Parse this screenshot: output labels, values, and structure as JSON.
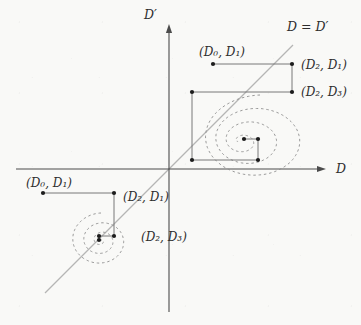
{
  "axes": {
    "x_label": "D",
    "y_label": "D′",
    "diagonal_label": "D = D′"
  },
  "upper_cobweb": {
    "labels": {
      "p01": "(D₀, D₁)",
      "p21": "(D₂, D₁)",
      "p23": "(D₂, D₃)"
    }
  },
  "lower_cobweb": {
    "labels": {
      "p01": "(D₀, D₁)",
      "p21": "(D₂, D₁)",
      "p23": "(D₂, D₃)"
    }
  },
  "colors": {
    "background": "#f9f9f7",
    "axis": "#4c4c4c",
    "cobweb": "#787878",
    "diagonal": "#b5b5b5",
    "spiral": "#8f8f8f",
    "dot": "#1c1c1c",
    "text": "#2e2e2e"
  }
}
